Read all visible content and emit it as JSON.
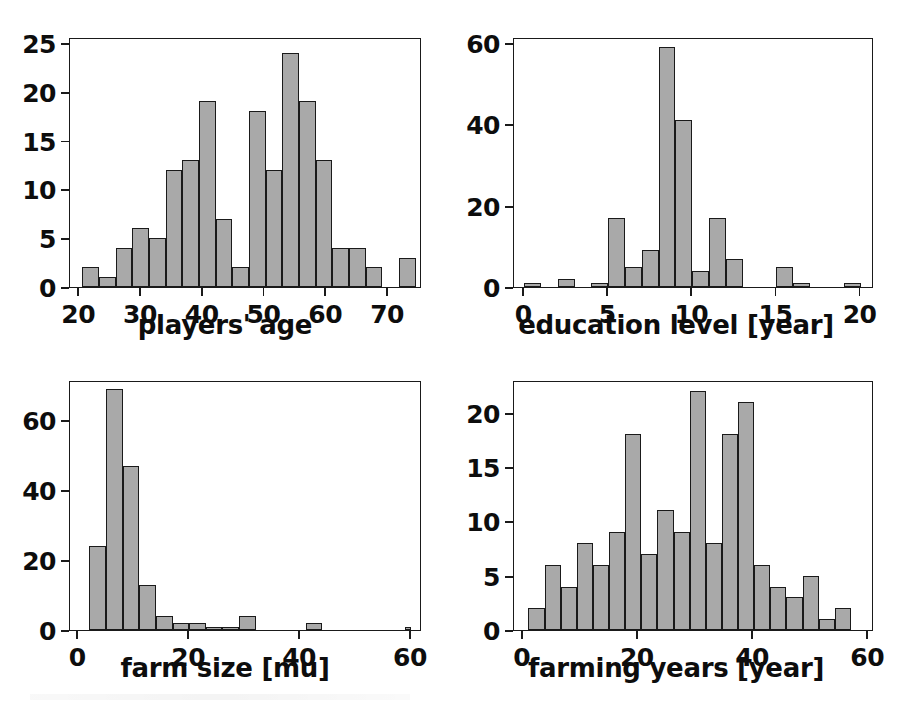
{
  "figure": {
    "background": "#ffffff",
    "bar_fill": "#a9a9a9",
    "bar_edge": "#1a1a1a",
    "panel_count": 4
  },
  "chart_data": [
    {
      "id": "players-age",
      "type": "bar",
      "title": "",
      "xlabel": "players' age",
      "ylabel": "",
      "xlim": [
        18.5,
        75.5
      ],
      "ylim": [
        0,
        25.6
      ],
      "xticks": [
        20,
        30,
        40,
        50,
        60,
        70
      ],
      "yticks": [
        0,
        5,
        10,
        15,
        20,
        25
      ],
      "xticklabels": [
        "20",
        "30",
        "40",
        "50",
        "60",
        "70"
      ],
      "yticklabels": [
        "0",
        "5",
        "10",
        "15",
        "20",
        "25"
      ],
      "grid": false,
      "legend": false,
      "bin_edges": [
        20.5,
        23.2,
        25.9,
        28.6,
        31.3,
        34.0,
        36.7,
        39.4,
        42.1,
        44.8,
        47.5,
        50.2,
        52.9,
        55.6,
        58.3,
        61.0,
        63.7,
        66.4,
        69.1,
        71.8,
        74.5
      ],
      "categories": [
        "20.5-23.2",
        "23.2-25.9",
        "25.9-28.6",
        "28.6-31.3",
        "31.3-34.0",
        "34.0-36.7",
        "36.7-39.4",
        "39.4-42.1",
        "42.1-44.8",
        "44.8-47.5",
        "47.5-50.2",
        "50.2-52.9",
        "52.9-55.6",
        "55.6-58.3",
        "58.3-61.0",
        "61.0-63.7",
        "63.7-66.4",
        "66.4-69.1",
        "69.1-71.8",
        "71.8-74.5"
      ],
      "values": [
        2,
        1,
        4,
        6,
        5,
        12,
        13,
        19,
        7,
        2,
        18,
        12,
        24,
        19,
        13,
        4,
        4,
        2,
        0,
        3
      ]
    },
    {
      "id": "education-level",
      "type": "bar",
      "title": "",
      "xlabel": "education level [year]",
      "ylabel": "",
      "xlim": [
        -0.6,
        20.8
      ],
      "ylim": [
        0,
        61.5
      ],
      "xticks": [
        0,
        5,
        10,
        15,
        20
      ],
      "yticks": [
        0,
        20,
        40,
        60
      ],
      "xticklabels": [
        "0",
        "5",
        "10",
        "15",
        "20"
      ],
      "yticklabels": [
        "0",
        "20",
        "40",
        "60"
      ],
      "grid": false,
      "legend": false,
      "bin_edges": [
        0.0,
        1.0,
        2.0,
        3.0,
        4.0,
        5.0,
        6.0,
        7.0,
        8.0,
        9.0,
        10.0,
        11.0,
        12.0,
        13.0,
        14.0,
        15.0,
        16.0,
        17.0,
        18.0,
        19.0,
        20.0
      ],
      "categories": [
        "0-1",
        "1-2",
        "2-3",
        "3-4",
        "4-5",
        "5-6",
        "6-7",
        "7-8",
        "8-9",
        "9-10",
        "10-11",
        "11-12",
        "12-13",
        "13-14",
        "14-15",
        "15-16",
        "16-17",
        "17-18",
        "18-19",
        "19-20"
      ],
      "values": [
        1,
        0,
        2,
        0,
        1,
        17,
        5,
        9,
        59,
        41,
        4,
        17,
        7,
        0,
        0,
        5,
        1,
        0,
        0,
        1
      ]
    },
    {
      "id": "farm-size",
      "type": "bar",
      "title": "",
      "xlabel": "farm size [mu]",
      "ylabel": "",
      "xlim": [
        -1.5,
        62.0
      ],
      "ylim": [
        0,
        71.5
      ],
      "xticks": [
        0,
        20,
        40,
        60
      ],
      "yticks": [
        0,
        20,
        40,
        60
      ],
      "xticklabels": [
        "0",
        "20",
        "40",
        "60"
      ],
      "yticklabels": [
        "0",
        "20",
        "40",
        "60"
      ],
      "grid": false,
      "legend": false,
      "bin_edges": [
        2.0,
        5.0,
        8.0,
        11.0,
        14.0,
        17.0,
        20.0,
        23.0,
        26.0,
        29.0,
        32.0,
        35.0,
        38.0,
        41.0,
        44.0,
        47.0,
        50.0,
        53.0,
        56.0,
        59.0,
        60.0
      ],
      "categories": [
        "2-5",
        "5-8",
        "8-11",
        "11-14",
        "14-17",
        "17-20",
        "20-23",
        "23-26",
        "26-29",
        "29-32",
        "32-35",
        "35-38",
        "38-41",
        "41-44",
        "44-47",
        "47-50",
        "50-53",
        "53-56",
        "56-59",
        "59-60"
      ],
      "values": [
        24,
        69,
        47,
        13,
        4,
        2,
        2,
        1,
        1,
        4,
        0,
        0,
        0,
        2,
        0,
        0,
        0,
        0,
        0,
        1
      ]
    },
    {
      "id": "farming-years",
      "type": "bar",
      "title": "",
      "xlabel": "farming years [year]",
      "ylabel": "",
      "xlim": [
        -1.5,
        61.0
      ],
      "ylim": [
        0,
        23.0
      ],
      "xticks": [
        0,
        20,
        40,
        60
      ],
      "yticks": [
        0,
        5,
        10,
        15,
        20
      ],
      "xticklabels": [
        "0",
        "20",
        "40",
        "60"
      ],
      "yticklabels": [
        "0",
        "5",
        "10",
        "15",
        "20"
      ],
      "grid": false,
      "legend": false,
      "bin_edges": [
        1.0,
        3.8,
        6.6,
        9.4,
        12.2,
        15.0,
        17.8,
        20.6,
        23.4,
        26.2,
        29.0,
        31.8,
        34.6,
        37.4,
        40.2,
        43.0,
        45.8,
        48.6,
        51.4,
        54.2,
        57.0
      ],
      "categories": [
        "1-3.8",
        "3.8-6.6",
        "6.6-9.4",
        "9.4-12.2",
        "12.2-15",
        "15-17.8",
        "17.8-20.6",
        "20.6-23.4",
        "23.4-26.2",
        "26.2-29",
        "29-31.8",
        "31.8-34.6",
        "34.6-37.4",
        "37.4-40.2",
        "40.2-43",
        "43-45.8",
        "45.8-48.6",
        "48.6-51.4",
        "51.4-54.2",
        "54.2-57"
      ],
      "values": [
        2,
        6,
        4,
        8,
        6,
        9,
        18,
        7,
        11,
        9,
        22,
        8,
        18,
        21,
        6,
        4,
        3,
        5,
        1,
        2
      ]
    }
  ]
}
